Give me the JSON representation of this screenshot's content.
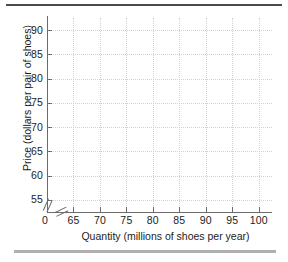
{
  "chart_data": {
    "type": "line",
    "title": "",
    "subtitle": "",
    "xlabel": "Quantity (millions of shoes per year)",
    "ylabel": "Price (dollars per pair of shoes)",
    "xlim": [
      60,
      102.5
    ],
    "ylim": [
      52.5,
      92.5
    ],
    "x_ticks": [
      0,
      65,
      70,
      75,
      80,
      85,
      90,
      95,
      100
    ],
    "y_ticks": [
      55,
      60,
      65,
      70,
      75,
      80,
      85,
      90
    ],
    "x_tick_labels": [
      "0",
      "65",
      "70",
      "75",
      "80",
      "85",
      "90",
      "95",
      "100"
    ],
    "y_tick_labels": [
      "55",
      "60",
      "65",
      "70",
      "75",
      "80",
      "85",
      "90"
    ],
    "grid": true,
    "grid_style": "dotted",
    "legend": null,
    "series": [],
    "annotations": [],
    "axis_break_x": true,
    "axis_break_y": true
  },
  "style": {
    "grid_color": "#d2d2d2",
    "axis_color": "#6b6b6b",
    "text_color": "#1c1c1c",
    "top_rule_color": "#4a4a4a",
    "bottom_rule_color": "#b0b0b0",
    "background": "#ffffff"
  },
  "decorations": {
    "top_rule": "",
    "bottom_rule": ""
  }
}
